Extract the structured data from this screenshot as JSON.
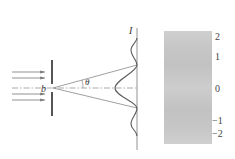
{
  "diagram": {
    "labels": {
      "slit_width": "b",
      "angle": "θ",
      "intensity": "I"
    },
    "fringe_pattern": {
      "order_labels": [
        "2",
        "1",
        "0",
        "−1",
        "−2"
      ]
    },
    "colors": {
      "line": "#6e6e6e",
      "slit": "#555555",
      "pattern_panel": "#c9c9c9",
      "curve": "#5a5a5a"
    }
  }
}
